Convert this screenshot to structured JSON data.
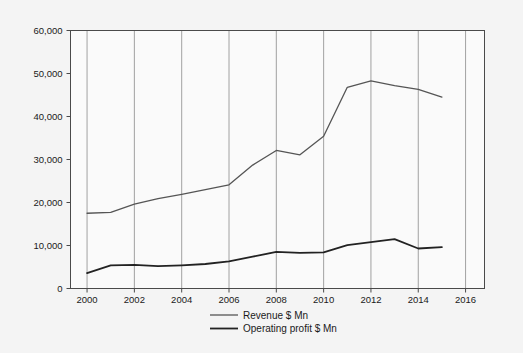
{
  "chart_data": {
    "type": "line",
    "title": "",
    "subtitle": "",
    "xlabel": "",
    "ylabel": "",
    "x": [
      2000,
      2001,
      2002,
      2003,
      2004,
      2005,
      2006,
      2007,
      2008,
      2009,
      2010,
      2011,
      2012,
      2013,
      2014,
      2015
    ],
    "xlim": [
      1999.3,
      2016.8
    ],
    "ylim": [
      0,
      60000
    ],
    "xticks": [
      2000,
      2002,
      2004,
      2006,
      2008,
      2010,
      2012,
      2014,
      2016
    ],
    "xtick_labels": [
      "2000",
      "2002",
      "2004",
      "2006",
      "2008",
      "2010",
      "2012",
      "2014",
      "2016"
    ],
    "yticks": [
      0,
      10000,
      20000,
      30000,
      40000,
      50000,
      60000
    ],
    "ytick_labels": [
      "0",
      "10,000",
      "20,000",
      "30,000",
      "40,000",
      "50,000",
      "60,000"
    ],
    "grid": "vertical-only",
    "legend_position": "bottom-center",
    "series": [
      {
        "name": "Revenue $ Mn",
        "color": "#555555",
        "width": 1.3,
        "values": [
          17500,
          17700,
          19600,
          20900,
          21900,
          23000,
          24100,
          28700,
          32100,
          31100,
          35400,
          46800,
          48300,
          47200,
          46300,
          44500
        ]
      },
      {
        "name": "Operating profit $ Mn",
        "color": "#222222",
        "width": 1.8,
        "values": [
          3600,
          5400,
          5500,
          5200,
          5400,
          5700,
          6300,
          7400,
          8500,
          8300,
          8400,
          10100,
          10800,
          11500,
          9300,
          9600
        ]
      }
    ]
  },
  "legend": {
    "items": [
      {
        "label": "Revenue $ Mn",
        "color": "#555555",
        "width": 1.3
      },
      {
        "label": "Operating profit $ Mn",
        "color": "#222222",
        "width": 1.8
      }
    ]
  },
  "colors": {
    "background": "#f4f4f4",
    "plot_background": "#fafafa",
    "axis": "#4a4a4a",
    "gridline": "#8a8a8a",
    "text": "#1a1a1a"
  }
}
